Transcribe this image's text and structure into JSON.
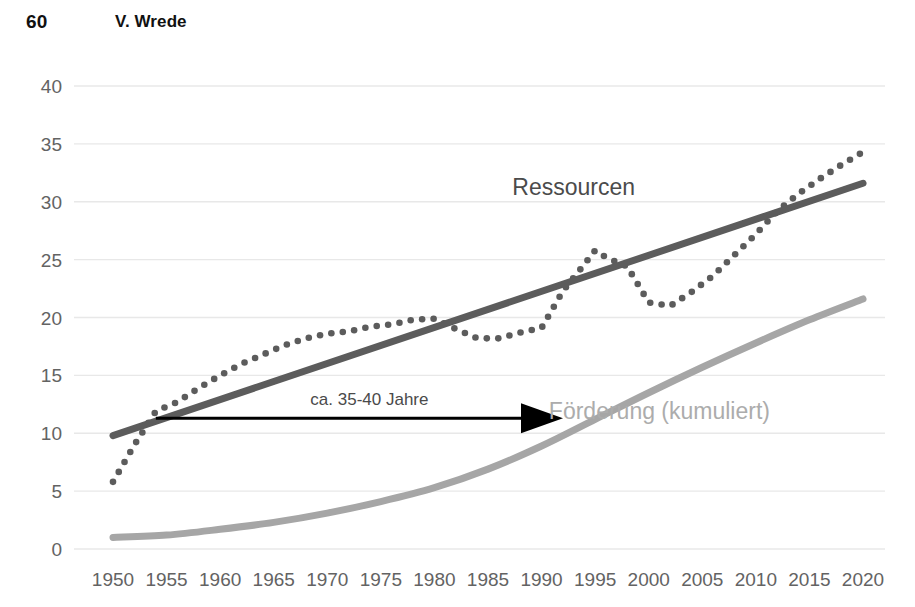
{
  "header": {
    "page_number": "60",
    "author": "V. Wrede"
  },
  "chart_data": {
    "type": "line",
    "title": "",
    "subtitle": "",
    "xlabel": "",
    "ylabel": "",
    "xlim": [
      1950,
      2020
    ],
    "ylim": [
      0,
      40
    ],
    "grid": true,
    "grid_axis": "y",
    "legend_position": "inline-annotation",
    "x_ticks": [
      "1950",
      "1955",
      "1960",
      "1965",
      "1970",
      "1975",
      "1980",
      "1985",
      "1990",
      "1995",
      "2000",
      "2005",
      "2010",
      "2015",
      "2020"
    ],
    "y_ticks": [
      "0",
      "5",
      "10",
      "15",
      "20",
      "25",
      "30",
      "35",
      "40"
    ],
    "colors": {
      "ressourcen_trend": "#5c5c5c",
      "ressourcen_dotted": "#5c5c5c",
      "foerderung": "#a6a6a6",
      "annotation_arrow": "#000000",
      "grid": "#e8e8e8",
      "tick_text": "#636363",
      "label_dark": "#4b4b4b",
      "label_light": "#acacac"
    },
    "series": [
      {
        "name": "Ressourcen (Trend)",
        "style": "solid",
        "color": "#5c5c5c",
        "x": [
          1950,
          2020
        ],
        "values": [
          9.8,
          31.6
        ]
      },
      {
        "name": "Ressourcen (beobachtet)",
        "style": "dotted",
        "color": "#5c5c5c",
        "x": [
          1950,
          1952,
          1954,
          1956,
          1958,
          1960,
          1962,
          1964,
          1966,
          1968,
          1970,
          1972,
          1974,
          1976,
          1978,
          1980,
          1982,
          1984,
          1986,
          1988,
          1990,
          1992,
          1994,
          1995,
          1996,
          1998,
          2000,
          2002,
          2004,
          2006,
          2008,
          2010,
          2012,
          2014,
          2016,
          2018,
          2020
        ],
        "values": [
          5.8,
          9.0,
          11.9,
          12.7,
          13.9,
          15.0,
          16.0,
          16.8,
          17.6,
          18.2,
          18.6,
          18.8,
          19.2,
          19.4,
          19.8,
          19.9,
          19.0,
          18.2,
          18.2,
          18.7,
          19.1,
          22.3,
          24.6,
          25.8,
          25.2,
          24.4,
          21.3,
          21.0,
          22.2,
          23.6,
          25.4,
          27.2,
          29.2,
          30.7,
          32.0,
          33.2,
          34.3
        ]
      },
      {
        "name": "Förderung (kumuliert)",
        "style": "solid",
        "color": "#a6a6a6",
        "x": [
          1950,
          1955,
          1960,
          1965,
          1970,
          1975,
          1980,
          1985,
          1990,
          1995,
          2000,
          2005,
          2010,
          2015,
          2020
        ],
        "values": [
          1.0,
          1.2,
          1.7,
          2.3,
          3.1,
          4.1,
          5.3,
          6.9,
          8.9,
          11.2,
          13.5,
          15.7,
          17.8,
          19.8,
          21.6
        ]
      }
    ],
    "series_labels": [
      {
        "text": "Ressourcen",
        "x": 1993,
        "y": 30.6,
        "color": "#4b4b4b"
      },
      {
        "text": "Förderung (kumuliert)",
        "x": 2001,
        "y": 11.2,
        "color": "#acacac"
      }
    ],
    "annotations": [
      {
        "type": "arrow",
        "text": "ca. 35-40 Jahre",
        "x_start": 1954,
        "x_end": 1992,
        "y": 11.3,
        "color": "#000000"
      }
    ]
  }
}
